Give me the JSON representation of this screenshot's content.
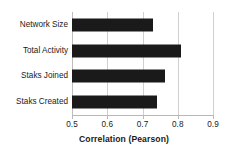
{
  "chart_data": {
    "type": "bar",
    "orientation": "horizontal",
    "title": "",
    "xlabel": "Correlation (Pearson)",
    "ylabel": "",
    "xlim": [
      0.5,
      0.9
    ],
    "xticks": [
      "0.5",
      "0.6",
      "0.7",
      "0.8",
      "0.9"
    ],
    "xtick_values": [
      0.5,
      0.6,
      0.7,
      0.8,
      0.9
    ],
    "grid": "vertical",
    "legend": "none",
    "bar_color": "#1a1a1a",
    "gridline_color": "#d0d0d0",
    "categories": [
      "Network Size",
      "Total Activity",
      "Staks Joined",
      "Staks Created"
    ],
    "values": [
      0.73,
      0.81,
      0.765,
      0.74
    ],
    "series": [
      {
        "name": "Correlation (Pearson)",
        "points": [
          {
            "category": "Network Size",
            "value": 0.73
          },
          {
            "category": "Total Activity",
            "value": 0.81
          },
          {
            "category": "Staks Joined",
            "value": 0.765
          },
          {
            "category": "Staks Created",
            "value": 0.74
          }
        ]
      }
    ]
  }
}
